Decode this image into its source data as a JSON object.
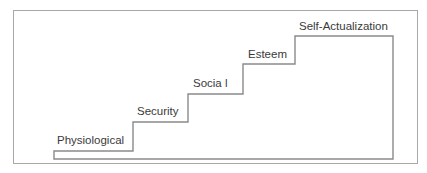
{
  "diagram": {
    "type": "staircase",
    "steps": [
      {
        "label": "Physiological"
      },
      {
        "label": "Security"
      },
      {
        "label": "Socia l"
      },
      {
        "label": "Esteem"
      },
      {
        "label": "Self-Actualization"
      }
    ]
  },
  "colors": {
    "frame": "#a8a8a8",
    "stairs": "#8a8a8a",
    "text": "#3a3a3a",
    "background": "#ffffff"
  }
}
